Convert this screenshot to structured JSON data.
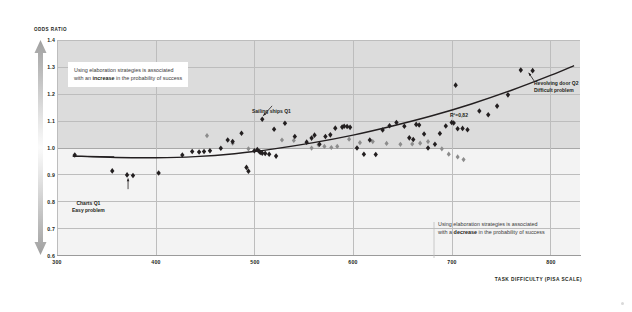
{
  "chart_data": {
    "type": "scatter",
    "title": "",
    "xlabel": "TASK DIFFICULTY (PISA SCALE)",
    "ylabel": "ODDS RATIO",
    "xlim": [
      300,
      830
    ],
    "ylim": [
      0.6,
      1.4
    ],
    "xticks": [
      300,
      400,
      500,
      600,
      700,
      800
    ],
    "yticks": [
      0.6,
      0.7,
      0.8,
      0.9,
      1.0,
      1.1,
      1.2,
      1.3,
      1.4
    ],
    "grid": true,
    "legend_position": "none",
    "reference_line_y": 1.0,
    "shaded_band": {
      "from_y": 1.0,
      "to_y": 1.4,
      "color": "#dcdcdc"
    },
    "annotations": [
      {
        "name": "r-squared",
        "text": "R²=0,82",
        "x": 690,
        "y": 1.13
      },
      {
        "name": "sailing-ships",
        "text": "Sailing ships Q1",
        "x": 520,
        "y": 1.175,
        "points_to": {
          "x": 508,
          "y": 1.105
        }
      },
      {
        "name": "charts-q1",
        "text": "Charts Q1\nEasy problem",
        "x": 372,
        "y": 0.79,
        "points_to": {
          "x": 372,
          "y": 0.895
        }
      },
      {
        "name": "revolving-door",
        "text": "Revolving door Q2\nDifficult problem",
        "x": 790,
        "y": 1.22,
        "points_to": {
          "x": 778,
          "y": 1.29
        }
      }
    ],
    "series": [
      {
        "name": "dark-markers",
        "color": "#231f20",
        "points": [
          [
            318,
            0.972
          ],
          [
            356,
            0.913
          ],
          [
            371,
            0.898
          ],
          [
            377,
            0.896
          ],
          [
            403,
            0.905
          ],
          [
            427,
            0.972
          ],
          [
            437,
            0.985
          ],
          [
            444,
            0.983
          ],
          [
            449,
            0.985
          ],
          [
            455,
            0.988
          ],
          [
            466,
            0.997
          ],
          [
            473,
            1.028
          ],
          [
            478,
            1.022
          ],
          [
            487,
            1.053
          ],
          [
            492,
            0.926
          ],
          [
            494,
            0.912
          ],
          [
            500,
            0.988
          ],
          [
            503,
            0.992
          ],
          [
            505,
            0.985
          ],
          [
            506,
            0.982
          ],
          [
            508,
            0.979
          ],
          [
            511,
            0.978
          ],
          [
            515,
            0.975
          ],
          [
            522,
            0.968
          ],
          [
            531,
            1.09
          ],
          [
            541,
            1.041
          ],
          [
            508,
            1.105
          ],
          [
            520,
            1.068
          ],
          [
            553,
            1.02
          ],
          [
            558,
            1.035
          ],
          [
            561,
            1.046
          ],
          [
            566,
            1.012
          ],
          [
            572,
            1.041
          ],
          [
            577,
            1.047
          ],
          [
            582,
            1.072
          ],
          [
            589,
            1.076
          ],
          [
            591,
            1.079
          ],
          [
            594,
            1.078
          ],
          [
            597,
            1.075
          ],
          [
            604,
            0.998
          ],
          [
            611,
            0.975
          ],
          [
            617,
            1.028
          ],
          [
            623,
            0.974
          ],
          [
            630,
            1.065
          ],
          [
            637,
            1.081
          ],
          [
            644,
            1.093
          ],
          [
            652,
            1.079
          ],
          [
            657,
            1.036
          ],
          [
            661,
            1.03
          ],
          [
            664,
            1.086
          ],
          [
            667,
            1.084
          ],
          [
            672,
            1.05
          ],
          [
            676,
            0.998
          ],
          [
            683,
            1.012
          ],
          [
            688,
            1.052
          ],
          [
            694,
            1.08
          ],
          [
            700,
            1.093
          ],
          [
            702,
            1.091
          ],
          [
            706,
            1.07
          ],
          [
            711,
            1.071
          ],
          [
            716,
            1.066
          ],
          [
            704,
            1.232
          ],
          [
            728,
            1.136
          ],
          [
            737,
            1.122
          ],
          [
            746,
            1.154
          ],
          [
            757,
            1.196
          ],
          [
            770,
            1.288
          ],
          [
            782,
            1.286
          ]
        ]
      },
      {
        "name": "grey-markers",
        "color": "#8c8c8c",
        "points": [
          [
            452,
            1.044
          ],
          [
            478,
            1.016
          ],
          [
            494,
            0.995
          ],
          [
            528,
            1.028
          ],
          [
            540,
            1.026
          ],
          [
            558,
            0.998
          ],
          [
            565,
            1.01
          ],
          [
            571,
            1.004
          ],
          [
            578,
            1.0
          ],
          [
            584,
            1.004
          ],
          [
            596,
            1.031
          ],
          [
            607,
            1.018
          ],
          [
            620,
            1.022
          ],
          [
            634,
            1.015
          ],
          [
            648,
            1.012
          ],
          [
            660,
            1.013
          ],
          [
            668,
            1.016
          ],
          [
            676,
            1.022
          ],
          [
            690,
            0.995
          ],
          [
            697,
            0.975
          ],
          [
            706,
            0.965
          ],
          [
            712,
            0.955
          ]
        ]
      }
    ],
    "trend_line": {
      "name": "fitted-curve",
      "color": "#231f20",
      "points": [
        [
          316,
          0.968
        ],
        [
          360,
          0.963
        ],
        [
          400,
          0.962
        ],
        [
          440,
          0.966
        ],
        [
          480,
          0.977
        ],
        [
          520,
          0.995
        ],
        [
          560,
          1.018
        ],
        [
          600,
          1.046
        ],
        [
          640,
          1.08
        ],
        [
          680,
          1.118
        ],
        [
          720,
          1.162
        ],
        [
          760,
          1.212
        ],
        [
          800,
          1.268
        ],
        [
          824,
          1.305
        ]
      ]
    }
  },
  "axes": {
    "y_title": "ODDS RATIO",
    "x_title": "TASK DIFFICULTY (PISA SCALE)",
    "y_ticks": [
      "1.4",
      "1.3",
      "1.2",
      "1.1",
      "1.0",
      "0.9",
      "0.8",
      "0.7",
      "0.6"
    ],
    "x_ticks": [
      "300",
      "400",
      "500",
      "600",
      "700",
      "800"
    ]
  },
  "callouts": {
    "top": {
      "line1_pre": "Using elaboration strategies is associated",
      "line2_pre": "with an ",
      "line2_bold": "increase",
      "line2_post": " in the probability of success"
    },
    "bottom": {
      "line1_pre": "Using elaboration strategies is associated",
      "line2_pre": "with a ",
      "line2_bold": "decrease",
      "line2_post": " in the probability of success"
    }
  },
  "point_labels": {
    "sailing": "Sailing ships Q1",
    "charts_line1": "Charts Q1",
    "charts_line2": "Easy problem",
    "revolving_line1": "Revolving door Q2",
    "revolving_line2": "Difficult problem",
    "r2": "R²=0,82"
  },
  "colors": {
    "plot_background": "#f3f3f3",
    "band": "#dcdcdc",
    "grid": "#bdbdbd",
    "marker_dark": "#231f20",
    "marker_grey": "#8c8c8c",
    "trend": "#231f20",
    "arrow_grey": "#9a9a9a"
  }
}
